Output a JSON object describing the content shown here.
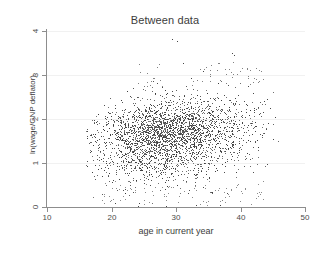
{
  "chart_data": {
    "type": "scatter",
    "title": "Between data",
    "xlabel": "age in current year",
    "ylabel": "ln(wage/GNP deflator)",
    "xlim": [
      10,
      50
    ],
    "ylim": [
      0,
      4
    ],
    "xticks": [
      "10",
      "20",
      "30",
      "40",
      "50"
    ],
    "xtick_values": [
      10,
      20,
      30,
      40,
      50
    ],
    "yticks": [
      "0",
      "1",
      "2",
      "3",
      "4"
    ],
    "ytick_values": [
      0,
      1,
      2,
      3,
      4
    ],
    "grid": "faint-horizontal",
    "legend": "none",
    "marker_color": "#4d4d4d",
    "marker_size_px": 1,
    "n_points": 2800,
    "distribution": {
      "x_center": 28.8,
      "x_spread": 5.3,
      "x_min": 16.0,
      "x_max": 46.0,
      "y_center": 1.63,
      "y_spread": 0.42,
      "y_min": 0.0,
      "y_max": 3.85,
      "correlation": 0.23
    },
    "sample_points": [
      [
        16.2,
        1.72
      ],
      [
        16.6,
        1.24
      ],
      [
        17.1,
        1.41
      ],
      [
        17.4,
        0.95
      ],
      [
        17.8,
        1.53
      ],
      [
        18.0,
        1.36
      ],
      [
        18.3,
        1.62
      ],
      [
        18.5,
        0.71
      ],
      [
        18.9,
        1.18
      ],
      [
        19.2,
        1.47
      ],
      [
        19.6,
        1.8
      ],
      [
        20.0,
        1.35
      ],
      [
        20.3,
        0.62
      ],
      [
        20.7,
        1.55
      ],
      [
        21.0,
        1.95
      ],
      [
        21.5,
        1.28
      ],
      [
        22.0,
        1.66
      ],
      [
        22.4,
        2.1
      ],
      [
        22.9,
        1.44
      ],
      [
        23.3,
        1.79
      ],
      [
        23.8,
        1.52
      ],
      [
        24.2,
        2.21
      ],
      [
        24.7,
        1.33
      ],
      [
        25.1,
        1.88
      ],
      [
        25.6,
        1.6
      ],
      [
        26.0,
        2.35
      ],
      [
        26.4,
        1.47
      ],
      [
        26.9,
        1.74
      ],
      [
        27.3,
        2.02
      ],
      [
        27.8,
        1.58
      ],
      [
        28.2,
        1.91
      ],
      [
        28.6,
        1.4
      ],
      [
        29.0,
        2.44
      ],
      [
        29.5,
        1.69
      ],
      [
        29.9,
        1.15
      ],
      [
        30.4,
        2.08
      ],
      [
        30.8,
        1.77
      ],
      [
        31.2,
        2.52
      ],
      [
        31.7,
        1.5
      ],
      [
        32.1,
        1.86
      ],
      [
        32.6,
        2.26
      ],
      [
        33.0,
        1.63
      ],
      [
        33.5,
        2.01
      ],
      [
        33.9,
        1.39
      ],
      [
        34.4,
        2.4
      ],
      [
        34.8,
        1.72
      ],
      [
        35.2,
        2.14
      ],
      [
        35.7,
        1.55
      ],
      [
        36.1,
        1.93
      ],
      [
        36.6,
        2.3
      ],
      [
        37.0,
        1.66
      ],
      [
        37.5,
        2.55
      ],
      [
        37.9,
        1.42
      ],
      [
        38.3,
        2.05
      ],
      [
        38.8,
        1.8
      ],
      [
        39.2,
        2.47
      ],
      [
        39.7,
        1.58
      ],
      [
        40.1,
        2.18
      ],
      [
        40.6,
        1.71
      ],
      [
        41.0,
        2.33
      ],
      [
        41.5,
        1.49
      ],
      [
        41.9,
        2.6
      ],
      [
        42.4,
        1.85
      ],
      [
        42.8,
        2.12
      ],
      [
        43.3,
        1.64
      ],
      [
        43.7,
        2.41
      ],
      [
        44.2,
        1.9
      ],
      [
        44.6,
        2.25
      ],
      [
        45.0,
        1.55
      ],
      [
        45.4,
        2.05
      ],
      [
        29.3,
        3.83
      ],
      [
        30.1,
        3.78
      ],
      [
        31.1,
        3.28
      ],
      [
        38.6,
        3.51
      ],
      [
        39.0,
        3.45
      ],
      [
        28.5,
        0.02
      ],
      [
        33.1,
        0.05
      ],
      [
        24.1,
        0.03
      ],
      [
        36.8,
        0.04
      ],
      [
        20.6,
        0.1
      ]
    ]
  }
}
